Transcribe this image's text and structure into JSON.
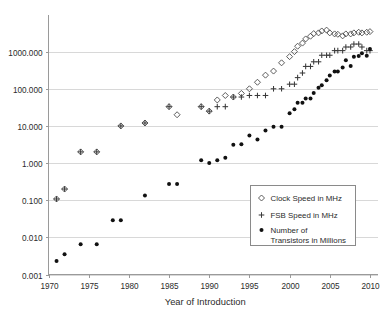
{
  "chart_data": {
    "type": "scatter",
    "title": "",
    "xlabel": "Year of Introduction",
    "ylabel": "",
    "xlim": [
      1970,
      2011
    ],
    "ylim": [
      0.001,
      10000
    ],
    "yscale": "log",
    "grid": true,
    "legend_position": "center-right",
    "xticks": [
      "1970",
      "1975",
      "1980",
      "1985",
      "1990",
      "1995",
      "2000",
      "2005",
      "2010"
    ],
    "xtick_values": [
      1970,
      1975,
      1980,
      1985,
      1990,
      1995,
      2000,
      2005,
      2010
    ],
    "yticks": [
      "0.001",
      "0.010",
      "0.100",
      "1.000",
      "10.000",
      "100.000",
      "1000.000"
    ],
    "ytick_values": [
      0.001,
      0.01,
      0.1,
      1,
      10,
      100,
      1000
    ],
    "series": [
      {
        "name": "Clock Speed in MHz",
        "marker": "open-diamond",
        "color": "#4a4a4a",
        "points": [
          [
            1971,
            0.108
          ],
          [
            1972,
            0.2
          ],
          [
            1974,
            2.0
          ],
          [
            1976,
            2.0
          ],
          [
            1979,
            10.0
          ],
          [
            1982,
            12.0
          ],
          [
            1985,
            33.0
          ],
          [
            1986,
            20.0
          ],
          [
            1989,
            33.0
          ],
          [
            1990,
            25.0
          ],
          [
            1991,
            50.0
          ],
          [
            1992,
            66.0
          ],
          [
            1993,
            60.0
          ],
          [
            1994,
            75.0
          ],
          [
            1995,
            100.0
          ],
          [
            1996,
            150.0
          ],
          [
            1997,
            233.0
          ],
          [
            1998,
            300.0
          ],
          [
            1999,
            500.0
          ],
          [
            2000,
            733.0
          ],
          [
            2000.6,
            1000.0
          ],
          [
            2001,
            1400.0
          ],
          [
            2001.6,
            1700.0
          ],
          [
            2002,
            2200.0
          ],
          [
            2002.6,
            2600.0
          ],
          [
            2003,
            3060.0
          ],
          [
            2003.6,
            3200.0
          ],
          [
            2004,
            3600.0
          ],
          [
            2004.6,
            3800.0
          ],
          [
            2005,
            3200.0
          ],
          [
            2005.6,
            3000.0
          ],
          [
            2006,
            2930.0
          ],
          [
            2006.6,
            2660.0
          ],
          [
            2007,
            3000.0
          ],
          [
            2007.6,
            3000.0
          ],
          [
            2008,
            3200.0
          ],
          [
            2008.6,
            3330.0
          ],
          [
            2009,
            3200.0
          ],
          [
            2009.6,
            3330.0
          ],
          [
            2010,
            3460.0
          ]
        ]
      },
      {
        "name": "FSB Speed in MHz",
        "marker": "plus",
        "color": "#3a3a3a",
        "points": [
          [
            1971,
            0.108
          ],
          [
            1972,
            0.2
          ],
          [
            1974,
            2.0
          ],
          [
            1976,
            2.0
          ],
          [
            1979,
            10.0
          ],
          [
            1982,
            12.0
          ],
          [
            1985,
            33.0
          ],
          [
            1989,
            33.0
          ],
          [
            1990,
            25.0
          ],
          [
            1991,
            33.0
          ],
          [
            1992,
            33.0
          ],
          [
            1993,
            60.0
          ],
          [
            1994,
            60.0
          ],
          [
            1995,
            66.0
          ],
          [
            1996,
            66.0
          ],
          [
            1997,
            66.0
          ],
          [
            1998,
            100.0
          ],
          [
            1999,
            100.0
          ],
          [
            2000,
            133.0
          ],
          [
            2000.6,
            133.0
          ],
          [
            2001,
            200.0
          ],
          [
            2001.6,
            266.0
          ],
          [
            2002,
            400.0
          ],
          [
            2002.6,
            400.0
          ],
          [
            2003,
            533.0
          ],
          [
            2003.6,
            533.0
          ],
          [
            2004,
            800.0
          ],
          [
            2004.6,
            800.0
          ],
          [
            2005,
            800.0
          ],
          [
            2005.6,
            1066.0
          ],
          [
            2006,
            1066.0
          ],
          [
            2006.6,
            1066.0
          ],
          [
            2007,
            1333.0
          ],
          [
            2007.6,
            1333.0
          ],
          [
            2008,
            1600.0
          ],
          [
            2008.6,
            1600.0
          ],
          [
            2009,
            1333.0
          ],
          [
            2009.6,
            1066.0
          ],
          [
            2010,
            1066.0
          ]
        ]
      },
      {
        "name": "Number of Transistors in Millions",
        "marker": "filled-dot",
        "color": "#111111",
        "points": [
          [
            1971,
            0.0023
          ],
          [
            1972,
            0.0035
          ],
          [
            1974,
            0.0065
          ],
          [
            1976,
            0.0065
          ],
          [
            1978,
            0.029
          ],
          [
            1979,
            0.029
          ],
          [
            1982,
            0.134
          ],
          [
            1985,
            0.275
          ],
          [
            1986,
            0.275
          ],
          [
            1989,
            1.2
          ],
          [
            1990,
            1.0
          ],
          [
            1991,
            1.2
          ],
          [
            1992,
            1.4
          ],
          [
            1993,
            3.1
          ],
          [
            1994,
            3.2
          ],
          [
            1995,
            5.5
          ],
          [
            1996,
            4.3
          ],
          [
            1997,
            7.5
          ],
          [
            1998,
            9.5
          ],
          [
            1999,
            9.5
          ],
          [
            2000,
            22.0
          ],
          [
            2000.6,
            28.0
          ],
          [
            2001,
            42.0
          ],
          [
            2001.6,
            42.0
          ],
          [
            2002,
            55.0
          ],
          [
            2002.6,
            55.0
          ],
          [
            2003,
            77.0
          ],
          [
            2003.6,
            106.0
          ],
          [
            2004,
            125.0
          ],
          [
            2004.6,
            169.0
          ],
          [
            2005,
            228.0
          ],
          [
            2005.6,
            291.0
          ],
          [
            2006,
            291.0
          ],
          [
            2006.6,
            376.0
          ],
          [
            2007,
            582.0
          ],
          [
            2007.6,
            411.0
          ],
          [
            2008,
            731.0
          ],
          [
            2008.6,
            758.0
          ],
          [
            2009,
            904.0
          ],
          [
            2009.6,
            774.0
          ],
          [
            2010,
            1170.0
          ]
        ]
      }
    ]
  },
  "legend": {
    "items": [
      {
        "marker": "open-diamond",
        "label": "Clock Speed in MHz"
      },
      {
        "marker": "plus",
        "label": "FSB Speed in MHz"
      },
      {
        "marker": "filled-dot",
        "label": "Number of",
        "label2": "Transistors in Millions"
      }
    ]
  },
  "colors": {
    "grid": "#d8d8d8",
    "axis": "#9a9a9a",
    "text": "#2b2b2b",
    "clock": "#4a4a4a",
    "fsb": "#3a3a3a",
    "transistors": "#111111"
  }
}
